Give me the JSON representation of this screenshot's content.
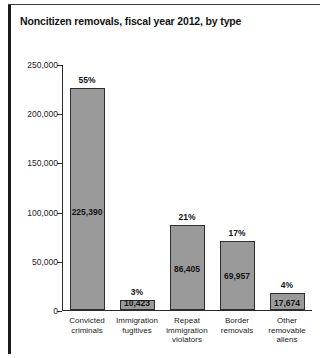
{
  "figure": {
    "title": "Noncitizen removals, fiscal year 2012, by type"
  },
  "colors": {
    "bar_fill": "#9a9a9a",
    "bar_stroke": "#2e2e2e",
    "axis": "#2a2a2a",
    "text": "#141414",
    "frame": "#1b1b1b"
  },
  "chart_data": {
    "type": "bar",
    "title": "Noncitizen removals, fiscal year 2012, by type",
    "xlabel": "",
    "ylabel": "",
    "ylim": [
      0,
      250000
    ],
    "grid": false,
    "legend": "none",
    "ytick_labels": [
      "0",
      "50,000",
      "100,000",
      "150,000",
      "200,000",
      "250,000"
    ],
    "ytick_values": [
      0,
      50000,
      100000,
      150000,
      200000,
      250000
    ],
    "categories": [
      "Convicted criminals",
      "Immigration fugitives",
      "Repeat immigration violators",
      "Border removals",
      "Other removable aliens"
    ],
    "category_lines": [
      [
        "Convicted",
        "criminals"
      ],
      [
        "Immigration",
        "fugitives"
      ],
      [
        "Repeat",
        "immigration",
        "violators"
      ],
      [
        "Border",
        "removals"
      ],
      [
        "Other",
        "removable",
        "aliens"
      ]
    ],
    "values": [
      225390,
      10423,
      86405,
      69957,
      17674
    ],
    "value_labels": [
      "225,390",
      "10,423",
      "86,405",
      "69,957",
      "17,674"
    ],
    "percent_labels": [
      "55%",
      "3%",
      "21%",
      "17%",
      "4%"
    ],
    "percents": [
      55,
      3,
      21,
      17,
      4
    ]
  }
}
